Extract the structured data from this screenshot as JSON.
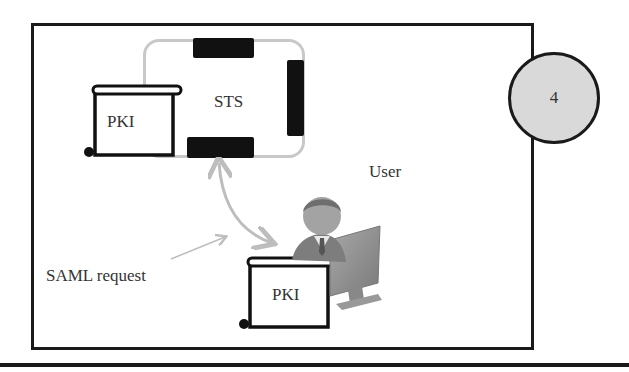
{
  "diagram": {
    "step_number": "4",
    "sts": {
      "label": "STS"
    },
    "pki_top": {
      "label": "PKI"
    },
    "pki_bottom": {
      "label": "PKI"
    },
    "user": {
      "label": "User"
    },
    "saml": {
      "label": "SAML request"
    }
  },
  "colors": {
    "outline": "#1a1a1a",
    "sts_frame": "#c8c8c8",
    "circle_fill": "#d9d9d9",
    "arrow": "#bdbdbd",
    "person_gray": "#8c8c8c"
  }
}
